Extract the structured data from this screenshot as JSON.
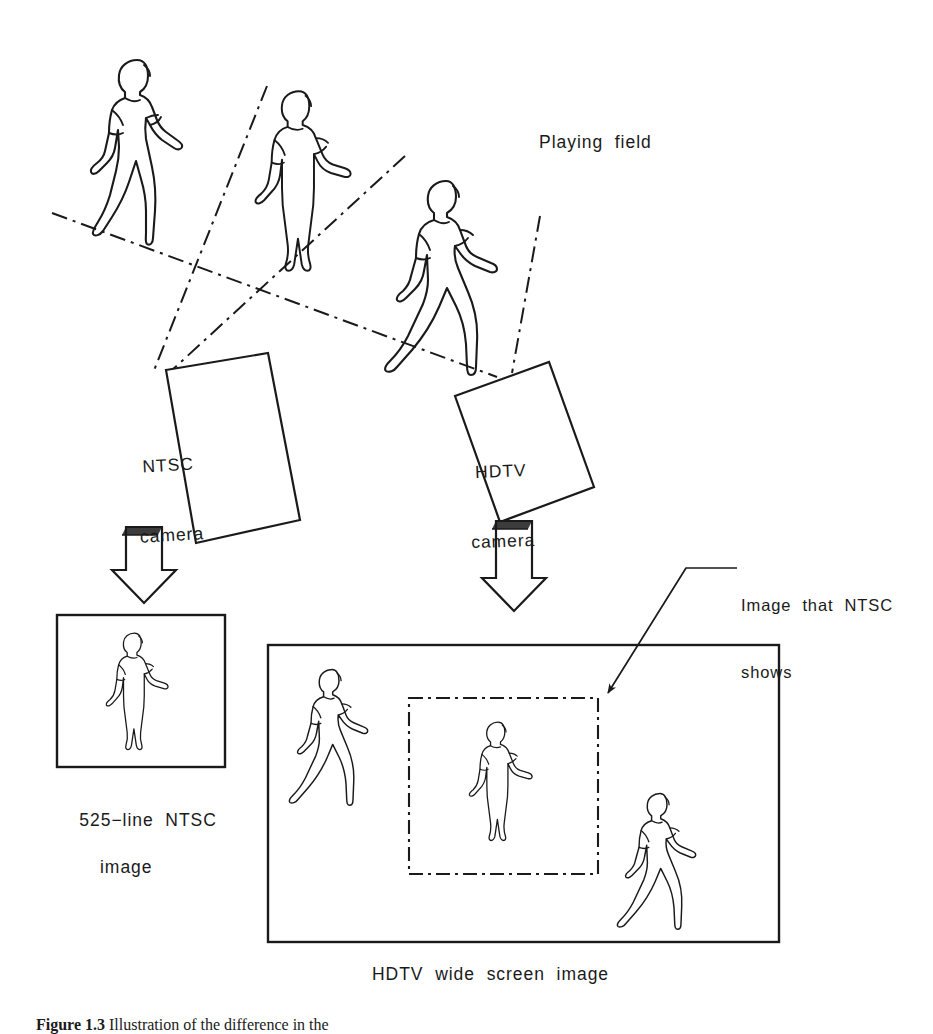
{
  "figure": {
    "caption_number": "Figure 1.3",
    "caption_text": "Illustration of the difference in the",
    "background_color": "#ffffff",
    "ink_color": "#1a1a1a"
  },
  "labels": {
    "playing_field": "Playing  field",
    "ntsc_camera_line1": "NTSC",
    "ntsc_camera_line2": "camera",
    "hdtv_camera_line1": "HDTV",
    "hdtv_camera_line2": "camera",
    "ntsc_image_line1": "525−line  NTSC",
    "ntsc_image_line2": "image",
    "hdtv_image": "HDTV  wide  screen  image",
    "callout_line1": "Image  that  NTSC",
    "callout_line2": "shows"
  },
  "scene": {
    "description": "Line drawing comparing the narrow NTSC camera field of view with the wide HDTV camera field of view on a playing field with three athletes.",
    "field_figures": [
      {
        "name": "athlete-walking-left",
        "pose": "walking",
        "x": 88,
        "y": 55,
        "scale": 1.0
      },
      {
        "name": "athlete-standing-center",
        "pose": "standing",
        "x": 250,
        "y": 85,
        "scale": 0.92
      },
      {
        "name": "athlete-striding-right",
        "pose": "striding",
        "x": 388,
        "y": 175,
        "scale": 1.0
      }
    ],
    "cameras": [
      {
        "name": "ntsc-camera",
        "label": "NTSC camera",
        "rotation_deg": -20
      },
      {
        "name": "hdtv-camera",
        "label": "HDTV camera",
        "rotation_deg": -12
      }
    ],
    "ntsc_output": {
      "frame_label": "525-line NTSC image",
      "aspect": "4:3",
      "figures": 1
    },
    "hdtv_output": {
      "frame_label": "HDTV wide screen image",
      "aspect": "16:9",
      "figures": 3,
      "inset_label": "Image that NTSC shows",
      "inset_line_style": "dash-dot"
    },
    "ray_line_style": "dash-dot",
    "arrow_style": "hollow-block-arrow"
  }
}
